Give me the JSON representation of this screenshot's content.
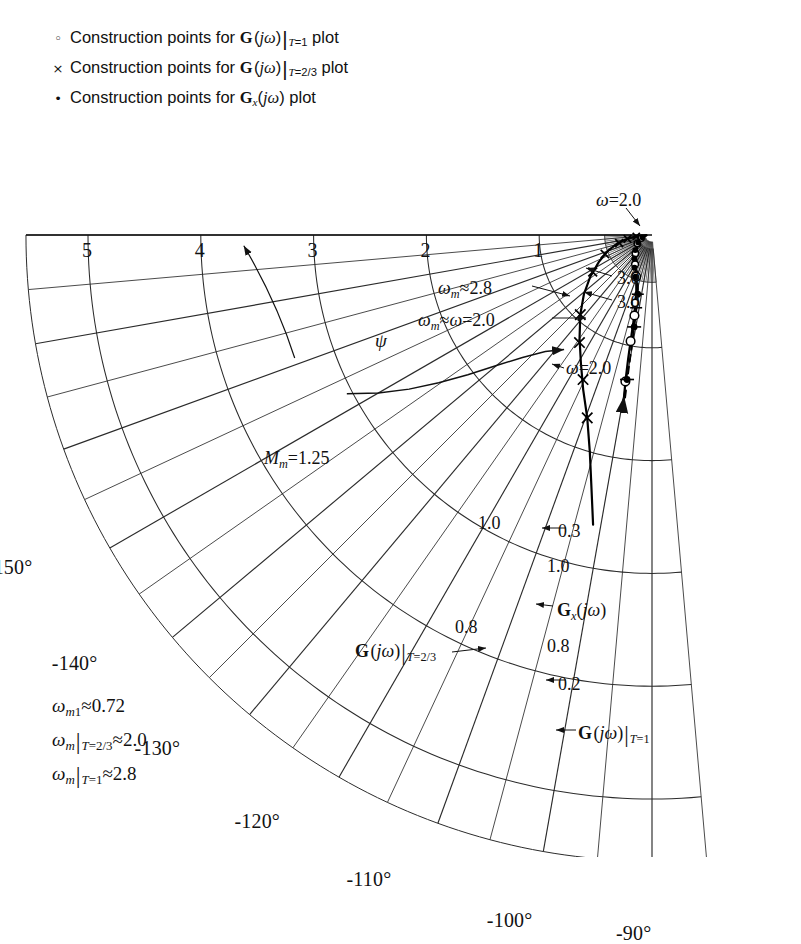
{
  "figure": {
    "kind": "polar-plot",
    "background": "#ffffff",
    "ink": "#111111",
    "grid_color": "#333333"
  },
  "legend": {
    "items": [
      {
        "marker": "open-circle-marker",
        "marker_glyph": "○",
        "text_html": "Construction points for <b class='bf'>G</b>&#8202;(<i class='m'>jω</i>)<span class='vbar'>|</span><span class='subit'>T</span><span class='sub'>=1</span> plot",
        "plain": "Construction points for G(jω)|T=1 plot"
      },
      {
        "marker": "cross-marker",
        "marker_glyph": "×",
        "text_html": "Construction points for <b class='bf'>G</b>&#8202;(<i class='m'>jω</i>)<span class='vbar'>|</span><span class='subit'>T</span><span class='sub'>=2/3</span> plot",
        "plain": "Construction points for G(jω)|T=2/3 plot"
      },
      {
        "marker": "filled-dot-marker",
        "marker_glyph": "•",
        "text_html": "Construction points for <b class='bf'>G</b><span class='subit'>x</span>(<i class='m'>jω</i>) plot",
        "plain": "Construction points for Gx(jω) plot"
      }
    ]
  },
  "corner_notes": [
    {
      "html": "<i class='m'>ω</i><span class='subit'>m</span><span class='sub'>1</span>≈0.72",
      "plain": "ωm1 ≈ 0.72"
    },
    {
      "html": "<i class='m'>ω</i><span class='subit'>m</span><span class='vbar'>|</span><span class='subit'>T</span><span class='sub'>=2/3</span>≈2.0",
      "plain": "ωm|T=2/3 ≈ 2.0"
    },
    {
      "html": "<i class='m'>ω</i><span class='subit'>m</span><span class='vbar'>|</span><span class='subit'>T</span><span class='sub'>=1</span>≈2.8",
      "plain": "ωm|T=1 ≈ 2.8"
    }
  ],
  "chart_data": {
    "type": "line",
    "plot_style": "polar (phase-magnitude) grid",
    "title": "",
    "center_px": [
      652,
      235
    ],
    "px_per_unit": 112.8,
    "radial_axis": {
      "label": "magnitude",
      "ticks": [
        5,
        4,
        3,
        2,
        1
      ],
      "tick_labels": [
        "5",
        "4",
        "3",
        "2",
        "1"
      ],
      "range": [
        0,
        5
      ],
      "axis_angle_deg": -180
    },
    "angular_axis": {
      "label": "phase angle",
      "labels": [
        "-180°",
        "-170°",
        "-160°",
        "-150°",
        "-140°",
        "-130°",
        "-120°",
        "-110°",
        "-100°",
        "-90°"
      ],
      "values_deg": [
        -180,
        -170,
        -160,
        -150,
        -140,
        -130,
        -120,
        -110,
        -100,
        -90
      ],
      "minor_step_deg": 5,
      "range_deg": [
        -180,
        -85
      ]
    },
    "grid": true,
    "legend_position": "top-left",
    "series": [
      {
        "name": "G(jω)|T=1",
        "marker": "open-circle",
        "line": "solid",
        "points": [
          {
            "omega": 0.2,
            "mag": 1.3,
            "phase_deg": -100.5
          },
          {
            "omega": 0.8,
            "mag": 0.95,
            "phase_deg": -101.5
          },
          {
            "omega": 1.0,
            "mag": 0.73,
            "phase_deg": -102.0
          },
          {
            "omega": 2.0,
            "mag": 0.36,
            "phase_deg": -113.0
          },
          {
            "omega": 3.0,
            "mag": 0.15,
            "phase_deg": -150.0
          }
        ]
      },
      {
        "name": "G(jω)|T=2/3",
        "marker": "cross",
        "line": "solid",
        "points": [
          {
            "omega": 0.8,
            "mag": 1.72,
            "phase_deg": -110.0
          },
          {
            "omega": 1.0,
            "mag": 1.42,
            "phase_deg": -116.0
          },
          {
            "omega": 2.0,
            "mag": 0.62,
            "phase_deg": -148.0
          },
          {
            "omega": 3.0,
            "mag": 0.22,
            "phase_deg": -170.0
          }
        ]
      },
      {
        "name": "Gx(jω)",
        "marker": "filled-dot",
        "line": "dashed",
        "points": [
          {
            "omega": 0.2,
            "mag": 1.31,
            "phase_deg": -100.0
          },
          {
            "omega": 0.3,
            "mag": 0.83,
            "phase_deg": -101.0
          },
          {
            "omega": 2.0,
            "mag": 0.4,
            "phase_deg": -128.0
          }
        ]
      }
    ],
    "contours": [
      {
        "name": "Mm-contour",
        "label": "Mm = 1.25",
        "value": 1.25
      }
    ],
    "annotations": [
      {
        "name": "omega-2-top",
        "html": "<i class='m'>ω</i>=2.0",
        "plain": "ω=2.0",
        "x": 596,
        "y": 190
      },
      {
        "name": "omega-3-upper",
        "html": "3.0",
        "plain": "3.0",
        "x": 617,
        "y": 268
      },
      {
        "name": "omega-3-lower",
        "html": "3.0",
        "plain": "3.0",
        "x": 617,
        "y": 292
      },
      {
        "name": "omega-m-2p8",
        "html": "<i class='m'>ω</i><span class='subit'>m</span>≈2.8",
        "plain": "ωm≈2.8",
        "x": 438,
        "y": 278
      },
      {
        "name": "omega-m-eq-2p0",
        "html": "<i class='m'>ω</i><span class='subit'>m</span>≈<i class='m'>ω</i>=2.0",
        "plain": "ωm≈ω=2.0",
        "x": 418,
        "y": 310
      },
      {
        "name": "omega-2-mid",
        "html": "<i class='m'>ω</i>=2.0",
        "plain": "ω=2.0",
        "x": 566,
        "y": 358
      },
      {
        "name": "psi-label",
        "html": "<i class='m'>ψ</i>",
        "plain": "ψ",
        "x": 375,
        "y": 330
      },
      {
        "name": "mm-label",
        "html": "<i class='m'>M</i><span class='subit'>m</span>=1.25",
        "plain": "Mm=1.25",
        "x": 264,
        "y": 448
      },
      {
        "name": "point-1p0-cross",
        "html": "1.0",
        "plain": "1.0",
        "x": 478,
        "y": 513
      },
      {
        "name": "point-0p3",
        "html": "0.3",
        "plain": "0.3",
        "x": 558,
        "y": 521
      },
      {
        "name": "point-1p0-circle",
        "html": "1.0",
        "plain": "1.0",
        "x": 547,
        "y": 556
      },
      {
        "name": "gx-jw-label",
        "html": "<b class='bf'>G</b><span class='subit'>x</span>(<i class='m'>jω</i>)",
        "plain": "Gx(jω)",
        "x": 557,
        "y": 600
      },
      {
        "name": "point-0p8-cross",
        "html": "0.8",
        "plain": "0.8",
        "x": 455,
        "y": 617
      },
      {
        "name": "point-0p8-circle",
        "html": "0.8",
        "plain": "0.8",
        "x": 547,
        "y": 636
      },
      {
        "name": "g-jw-t23-label",
        "html": "<b class='bf'>G</b>&#8202;(<i class='m'>jω</i>)<span class='vbar'>|</span><span class='subit'>T</span><span class='sub'>=2/3</span>",
        "plain": "G(jω)|T=2/3",
        "x": 355,
        "y": 640
      },
      {
        "name": "point-0p2",
        "html": "0.2",
        "plain": "0.2",
        "x": 558,
        "y": 674
      },
      {
        "name": "g-jw-t1-label",
        "html": "<b class='bf'>G</b>&#8202;(<i class='m'>jω</i>)<span class='vbar'>|</span><span class='subit'>T</span><span class='sub'>=1</span>",
        "plain": "G(jω)|T=1",
        "x": 578,
        "y": 722
      }
    ]
  }
}
